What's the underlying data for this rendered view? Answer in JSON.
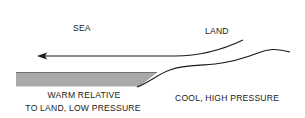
{
  "diagram": {
    "labels": {
      "sea": "SEA",
      "land": "LAND",
      "sea_condition_line1": "WARM RELATIVE",
      "sea_condition_line2": "TO LAND, LOW PRESSURE",
      "land_condition": "COOL, HIGH PRESSURE"
    },
    "arrow_direction": "land-to-sea",
    "colors": {
      "ink": "#1a1a1a",
      "sea_fill": "#a9a9a9",
      "background": "#ffffff"
    }
  }
}
